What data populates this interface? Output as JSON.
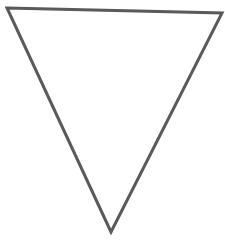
{
  "figure": {
    "shape": "inverted-triangle",
    "background_color": "#ffffff",
    "fill_color": "#ffffff",
    "stroke_color": "#5a5a5a",
    "stroke_width": 3,
    "vertices": {
      "top_left": [
        7,
        8
      ],
      "top_right": [
        222,
        13
      ],
      "bottom": [
        111,
        232
      ]
    }
  }
}
